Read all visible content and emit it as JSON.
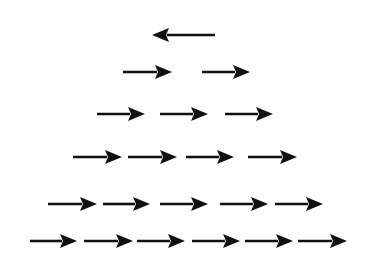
{
  "diagram": {
    "title": "",
    "background": "#ffffff",
    "arrow_color": "#111111",
    "rows": [
      {
        "y": 35,
        "arrows": [
          {
            "x1": 152,
            "x2": 215,
            "direction": "left"
          }
        ]
      },
      {
        "y": 72,
        "arrows": [
          {
            "x1": 123,
            "x2": 172,
            "direction": "right"
          },
          {
            "x1": 202,
            "x2": 250,
            "direction": "right"
          }
        ]
      },
      {
        "y": 114,
        "arrows": [
          {
            "x1": 97,
            "x2": 145,
            "direction": "right"
          },
          {
            "x1": 160,
            "x2": 208,
            "direction": "right"
          },
          {
            "x1": 225,
            "x2": 273,
            "direction": "right"
          }
        ]
      },
      {
        "y": 157,
        "arrows": [
          {
            "x1": 73,
            "x2": 122,
            "direction": "right"
          },
          {
            "x1": 128,
            "x2": 177,
            "direction": "right"
          },
          {
            "x1": 186,
            "x2": 234,
            "direction": "right"
          },
          {
            "x1": 248,
            "x2": 297,
            "direction": "right"
          }
        ]
      },
      {
        "y": 204,
        "arrows": [
          {
            "x1": 48,
            "x2": 97,
            "direction": "right"
          },
          {
            "x1": 103,
            "x2": 150,
            "direction": "right"
          },
          {
            "x1": 160,
            "x2": 208,
            "direction": "right"
          },
          {
            "x1": 220,
            "x2": 268,
            "direction": "right"
          },
          {
            "x1": 275,
            "x2": 323,
            "direction": "right"
          }
        ]
      },
      {
        "y": 241,
        "arrows": [
          {
            "x1": 30,
            "x2": 77,
            "direction": "right"
          },
          {
            "x1": 84,
            "x2": 133,
            "direction": "right"
          },
          {
            "x1": 137,
            "x2": 185,
            "direction": "right"
          },
          {
            "x1": 192,
            "x2": 240,
            "direction": "right"
          },
          {
            "x1": 245,
            "x2": 293,
            "direction": "right"
          },
          {
            "x1": 298,
            "x2": 347,
            "direction": "right"
          }
        ]
      }
    ]
  }
}
